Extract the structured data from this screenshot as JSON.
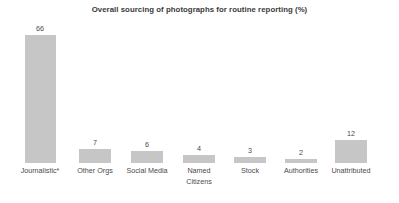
{
  "chart_data": {
    "type": "bar",
    "title": "Overall sourcing of photographs for routine reporting (%)",
    "xlabel": "",
    "ylabel": "",
    "ylim": [
      0,
      66
    ],
    "grid": false,
    "legend": "none",
    "categories": [
      "Journalistic*",
      "Other Orgs",
      "Social Media",
      "Named Citizens",
      "Stock",
      "Authorities",
      "Unattributed"
    ],
    "values": [
      66,
      7,
      6,
      4,
      3,
      2,
      12
    ],
    "data_labels": [
      "66",
      "7",
      "6",
      "4",
      "3",
      "2",
      "12"
    ],
    "bar_color": "#c6c6c6",
    "background_color": "#ffffff",
    "text_color": "#4a4a4a",
    "category_lines": [
      [
        "Journalistic*"
      ],
      [
        "Other Orgs"
      ],
      [
        "Social Media"
      ],
      [
        "Named",
        "Citizens"
      ],
      [
        "Stock"
      ],
      [
        "Authorities"
      ],
      [
        "Unattributed"
      ]
    ]
  }
}
